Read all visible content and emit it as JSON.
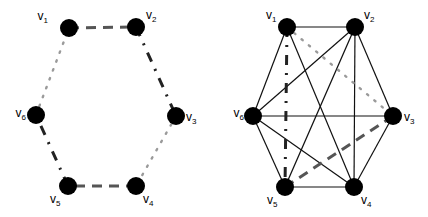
{
  "graphs": [
    {
      "id": "cycle",
      "vertices": [
        {
          "id": "v1",
          "name": "v",
          "sub": "1"
        },
        {
          "id": "v2",
          "name": "v",
          "sub": "2"
        },
        {
          "id": "v3",
          "name": "v",
          "sub": "3"
        },
        {
          "id": "v4",
          "name": "v",
          "sub": "4"
        },
        {
          "id": "v5",
          "name": "v",
          "sub": "5"
        },
        {
          "id": "v6",
          "name": "v",
          "sub": "6"
        }
      ],
      "edges": [
        {
          "from": "v1",
          "to": "v2",
          "style": "dashed"
        },
        {
          "from": "v2",
          "to": "v3",
          "style": "dashdot"
        },
        {
          "from": "v3",
          "to": "v4",
          "style": "dotted"
        },
        {
          "from": "v4",
          "to": "v5",
          "style": "dashed"
        },
        {
          "from": "v5",
          "to": "v6",
          "style": "dashdot"
        },
        {
          "from": "v6",
          "to": "v1",
          "style": "dotted"
        }
      ]
    },
    {
      "id": "complete",
      "vertices": [
        {
          "id": "v1",
          "name": "v",
          "sub": "1"
        },
        {
          "id": "v2",
          "name": "v",
          "sub": "2"
        },
        {
          "id": "v3",
          "name": "v",
          "sub": "3"
        },
        {
          "id": "v4",
          "name": "v",
          "sub": "4"
        },
        {
          "id": "v5",
          "name": "v",
          "sub": "5"
        },
        {
          "id": "v6",
          "name": "v",
          "sub": "6"
        }
      ],
      "edges": [
        {
          "from": "v1",
          "to": "v2",
          "style": "solid"
        },
        {
          "from": "v1",
          "to": "v6",
          "style": "solid"
        },
        {
          "from": "v1",
          "to": "v4",
          "style": "solid"
        },
        {
          "from": "v2",
          "to": "v3",
          "style": "solid"
        },
        {
          "from": "v2",
          "to": "v4",
          "style": "solid"
        },
        {
          "from": "v2",
          "to": "v5",
          "style": "solid"
        },
        {
          "from": "v2",
          "to": "v6",
          "style": "solid"
        },
        {
          "from": "v3",
          "to": "v4",
          "style": "solid"
        },
        {
          "from": "v3",
          "to": "v6",
          "style": "solid"
        },
        {
          "from": "v4",
          "to": "v5",
          "style": "solid"
        },
        {
          "from": "v4",
          "to": "v6",
          "style": "solid"
        },
        {
          "from": "v5",
          "to": "v6",
          "style": "solid"
        },
        {
          "from": "v1",
          "to": "v5",
          "style": "dashdot"
        },
        {
          "from": "v1",
          "to": "v3",
          "style": "dotted"
        },
        {
          "from": "v5",
          "to": "v3",
          "style": "dashed"
        }
      ]
    }
  ],
  "colors": {
    "vertex": "#000000",
    "solid": "#111111",
    "dashed": "#555555",
    "dashdot": "#222222",
    "dotted": "#9a9a9a"
  }
}
